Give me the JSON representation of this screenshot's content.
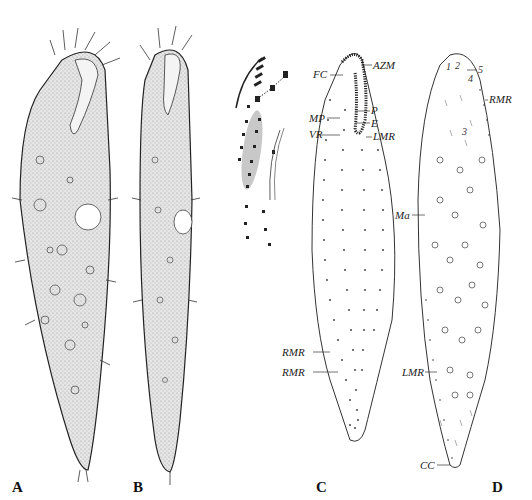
{
  "figure": {
    "panels": [
      {
        "id": "A",
        "label": "A",
        "description": "ciliate cell, ventral view, stippled with cilia"
      },
      {
        "id": "B",
        "label": "B",
        "description": "ciliate cell, slender, stippled with cilia"
      },
      {
        "id": "C",
        "label": "C",
        "description": "infraciliature, ventral view",
        "annotations": [
          "FC",
          "AZM",
          "MP",
          "VR",
          "P",
          "E",
          "LMR",
          "RMR",
          "RMR"
        ]
      },
      {
        "id": "D",
        "label": "D",
        "description": "infraciliature, dorsal view with macronuclear nodules",
        "annotations": [
          "RMR",
          "Ma",
          "LMR",
          "CC"
        ],
        "numbers": [
          "1",
          "2",
          "3",
          "4",
          "5"
        ]
      }
    ],
    "labels": {
      "A": "A",
      "B": "B",
      "C": "C",
      "D": "D",
      "FC": "FC",
      "AZM": "AZM",
      "MP": "MP",
      "VR": "VR",
      "P": "P",
      "E": "E",
      "LMR": "LMR",
      "RMR": "RMR",
      "Ma": "Ma",
      "CC": "CC",
      "n1": "1",
      "n2": "2",
      "n3": "3",
      "n4": "4",
      "n5": "5"
    },
    "colors": {
      "ink": "#222222",
      "stipple": "#d8d8d8",
      "highlight": "#c8c8c8",
      "background": "#ffffff"
    }
  }
}
